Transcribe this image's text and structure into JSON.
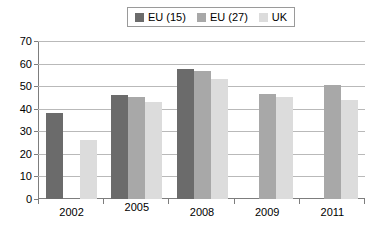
{
  "chart_data": {
    "type": "bar",
    "title": "",
    "subtitle": "",
    "xlabel": "",
    "ylabel": "",
    "categories": [
      "2002",
      "2005",
      "2008",
      "2009",
      "2011"
    ],
    "series": [
      {
        "name": "EU (15)",
        "color": "#6b6b6b",
        "values": [
          38,
          46,
          57.5,
          null,
          null
        ]
      },
      {
        "name": "EU (27)",
        "color": "#a8a8a8",
        "values": [
          null,
          45,
          56.5,
          46.5,
          50.5
        ]
      },
      {
        "name": "UK",
        "color": "#dcdcdc",
        "values": [
          26,
          43,
          53,
          45,
          44
        ]
      }
    ],
    "ylim": [
      0,
      70
    ],
    "yticks": [
      0,
      10,
      20,
      30,
      40,
      50,
      60,
      70
    ],
    "ytick_labels": [
      "0",
      "10",
      "20",
      "30",
      "40",
      "50",
      "60",
      "70"
    ],
    "grid": true,
    "grid_axis": "y",
    "legend_position": "top-center",
    "legend_entries": [
      "EU (15)",
      "EU (27)",
      "UK"
    ],
    "colors": {
      "series_1": "#6b6b6b",
      "series_2": "#a8a8a8",
      "series_3": "#dcdcdc",
      "gridline": "#b9b9b9",
      "axis": "#7d7d7d",
      "background": "#ffffff",
      "text": "#000000"
    }
  }
}
